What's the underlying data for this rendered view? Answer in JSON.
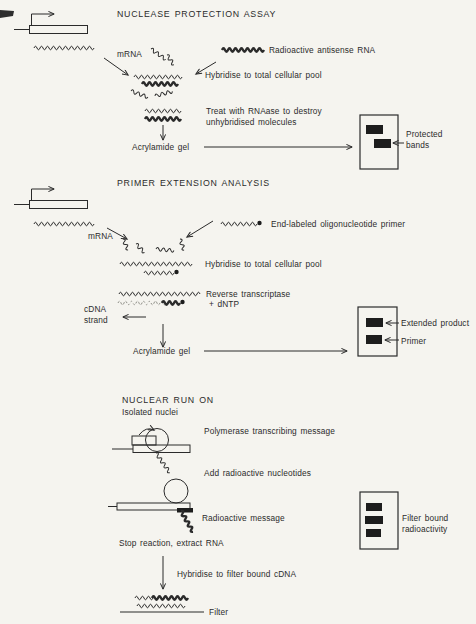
{
  "nuclease": {
    "title": "NUCLEASE PROTECTION ASSAY",
    "mrna_label": "mRNA",
    "antisense_label": "Radioactive antisense RNA",
    "hybridise_label": "Hybridise to total cellular pool",
    "treat_line1": "Treat with RNAase to destroy",
    "treat_line2": "unhybridised molecules",
    "gel_label": "Acrylamide gel",
    "protected_line1": "Protected",
    "protected_line2": "bands"
  },
  "primer_extension": {
    "title": "PRIMER EXTENSION ANALYSIS",
    "mrna_label": "mRNA",
    "primer_label": "End-labeled oligonucleotide primer",
    "hybridise_label": "Hybridise to total cellular pool",
    "rt_label": "Reverse transcriptase",
    "dntp_label": "+ dNTP",
    "cdna_line1": "cDNA",
    "cdna_line2": "strand",
    "gel_label": "Acrylamide gel",
    "extended_label": "Extended product",
    "primer_band_label": "Primer"
  },
  "nuclear_run_on": {
    "title": "NUCLEAR RUN ON",
    "isolated_label": "Isolated nuclei",
    "polymerase_label": "Polymerase transcribing message",
    "add_label": "Add radioactive nucleotides",
    "radioactive_label": "Radioactive message",
    "stop_label": "Stop reaction, extract RNA",
    "hybridise_label": "Hybridise to filter bound cDNA",
    "filter_label": "Filter",
    "filter_bound_line1": "Filter bound",
    "filter_bound_line2": "radioactivity"
  },
  "colors": {
    "ink": "#2b2b2b",
    "paper": "#f5f4ef",
    "band": "#1d1d1d"
  }
}
